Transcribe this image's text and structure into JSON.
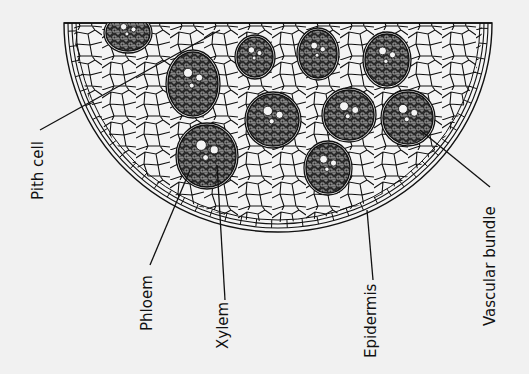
{
  "diagram": {
    "labels": {
      "pith_cell": "Pith cell",
      "phloem": "Phloem",
      "xylem": "Xylem",
      "epidermis": "Epidermis",
      "vascular_bundle": "Vascular bundle"
    },
    "colors": {
      "background": "#f1f1f1",
      "line": "#111111",
      "cell_fill": "#f4f4f4",
      "bundle_fill": "#2a2a2a"
    },
    "vascular_bundles": [
      {
        "cx": 128,
        "cy": 33,
        "rx": 22,
        "ry": 18
      },
      {
        "cx": 193,
        "cy": 84,
        "rx": 25,
        "ry": 32
      },
      {
        "cx": 255,
        "cy": 57,
        "rx": 18,
        "ry": 20
      },
      {
        "cx": 318,
        "cy": 54,
        "rx": 19,
        "ry": 24
      },
      {
        "cx": 387,
        "cy": 60,
        "rx": 22,
        "ry": 26
      },
      {
        "cx": 273,
        "cy": 120,
        "rx": 26,
        "ry": 26
      },
      {
        "cx": 349,
        "cy": 115,
        "rx": 25,
        "ry": 25
      },
      {
        "cx": 408,
        "cy": 118,
        "rx": 25,
        "ry": 26
      },
      {
        "cx": 207,
        "cy": 156,
        "rx": 29,
        "ry": 31
      },
      {
        "cx": 328,
        "cy": 168,
        "rx": 22,
        "ry": 25
      }
    ]
  }
}
